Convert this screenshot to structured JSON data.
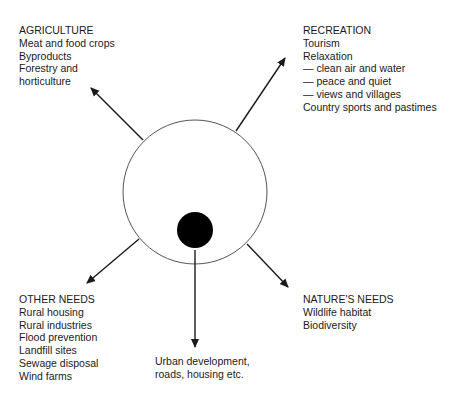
{
  "diagram": {
    "center": {
      "outer_circle": {
        "cx": 195,
        "cy": 192,
        "r": 72,
        "stroke": "#555555",
        "fill": "#ffffff"
      },
      "inner_dot": {
        "cx": 195,
        "cy": 230,
        "r": 18,
        "fill": "#000000"
      }
    },
    "arrows": [
      {
        "target": "agriculture",
        "x1": 143,
        "y1": 140,
        "x2": 91,
        "y2": 88
      },
      {
        "target": "recreation",
        "x1": 236,
        "y1": 131,
        "x2": 285,
        "y2": 58
      },
      {
        "target": "other_needs",
        "x1": 139,
        "y1": 239,
        "x2": 87,
        "y2": 283
      },
      {
        "target": "urban_development",
        "x1": 195,
        "y1": 250,
        "x2": 195,
        "y2": 347
      },
      {
        "target": "natures_needs",
        "x1": 247,
        "y1": 244,
        "x2": 288,
        "y2": 287
      }
    ],
    "colors": {
      "text": "#1a1a1a",
      "arrow": "#1a1a1a",
      "caption": "#c8c8c8"
    }
  },
  "agriculture": {
    "heading": "AGRICULTURE",
    "items": [
      "Meat and food crops",
      "Byproducts",
      "Forestry and",
      "horticulture"
    ]
  },
  "recreation": {
    "heading": "RECREATION",
    "items": [
      "Tourism",
      "Relaxation",
      "— clean air and water",
      "— peace and quiet",
      "— views and villages",
      "Country sports and pastimes"
    ]
  },
  "other_needs": {
    "heading": "OTHER NEEDS",
    "items": [
      "Rural housing",
      "Rural industries",
      "Flood prevention",
      "Landfill sites",
      "Sewage disposal",
      "Wind farms"
    ]
  },
  "natures_needs": {
    "heading": "NATURE'S NEEDS",
    "items": [
      "Wildlife habitat",
      "Biodiversity"
    ]
  },
  "urban": {
    "items": [
      "Urban development,",
      "roads, housing etc."
    ]
  }
}
